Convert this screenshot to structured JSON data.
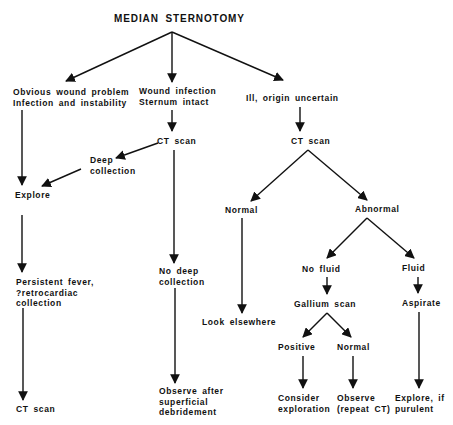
{
  "diagram": {
    "title": "MEDIAN STERNOTOMY",
    "type": "flowchart",
    "colors": {
      "ink": "#111111",
      "background": "#ffffff"
    },
    "nodes": {
      "obvious": "Obvious wound problem\nInfection and instability",
      "wound_intact": "Wound infection\nSternum intact",
      "ill_uncertain": "Ill, origin uncertain",
      "ct_scan_middle": "CT scan",
      "ct_scan_right": "CT scan",
      "deep_collection": "Deep\ncollection",
      "explore": "Explore",
      "normal_ct": "Normal",
      "abnormal_ct": "Abnormal",
      "persistent_fever": "Persistent fever,\n?retrocardiac\ncollection",
      "no_deep_collection": "No deep\ncollection",
      "no_fluid": "No fluid",
      "fluid": "Fluid",
      "gallium_scan": "Gallium scan",
      "aspirate": "Aspirate",
      "look_elsewhere": "Look elsewhere",
      "positive": "Positive",
      "normal_gallium": "Normal",
      "consider_exploration": "Consider\nexploration",
      "observe_repeat_ct": "Observe\n(repeat CT)",
      "explore_if_purulent": "Explore, if\npurulent",
      "observe_after_debridement": "Observe after\nsuperficial\ndebridement",
      "ct_scan_left": "CT scan"
    },
    "edges": [
      [
        "title",
        "obvious"
      ],
      [
        "title",
        "wound_intact"
      ],
      [
        "title",
        "ill_uncertain"
      ],
      [
        "obvious",
        "explore"
      ],
      [
        "wound_intact",
        "ct_scan_middle"
      ],
      [
        "ct_scan_middle",
        "deep_collection"
      ],
      [
        "deep_collection",
        "explore"
      ],
      [
        "ct_scan_middle",
        "no_deep_collection"
      ],
      [
        "ill_uncertain",
        "ct_scan_right"
      ],
      [
        "ct_scan_right",
        "normal_ct"
      ],
      [
        "ct_scan_right",
        "abnormal_ct"
      ],
      [
        "explore",
        "persistent_fever"
      ],
      [
        "persistent_fever",
        "ct_scan_left"
      ],
      [
        "no_deep_collection",
        "observe_after_debridement"
      ],
      [
        "normal_ct",
        "look_elsewhere"
      ],
      [
        "abnormal_ct",
        "no_fluid"
      ],
      [
        "abnormal_ct",
        "fluid"
      ],
      [
        "no_fluid",
        "gallium_scan"
      ],
      [
        "fluid",
        "aspirate"
      ],
      [
        "gallium_scan",
        "positive"
      ],
      [
        "gallium_scan",
        "normal_gallium"
      ],
      [
        "positive",
        "consider_exploration"
      ],
      [
        "normal_gallium",
        "observe_repeat_ct"
      ],
      [
        "aspirate",
        "explore_if_purulent"
      ]
    ]
  }
}
